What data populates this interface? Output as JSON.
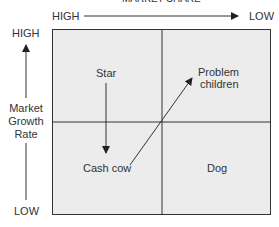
{
  "title": "MARKET SHARE",
  "x_axis": {
    "left": "HIGH",
    "right": "LOW"
  },
  "y_axis": {
    "top": "HIGH",
    "bottom": "LOW",
    "label_lines": [
      "Market",
      "Growth",
      "Rate"
    ]
  },
  "quadrants": {
    "top_left": "Star",
    "top_right_lines": [
      "Problem",
      "children"
    ],
    "bottom_left": "Cash cow",
    "bottom_right": "Dog"
  },
  "colors": {
    "box_fill": "#ececec",
    "line": "#333333"
  }
}
